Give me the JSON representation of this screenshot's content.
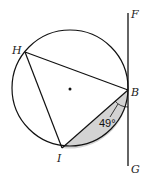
{
  "diagram": {
    "points": {
      "H": "H",
      "B": "B",
      "I": "I",
      "F": "F",
      "G": "G"
    },
    "angle_label": "49°",
    "colors": {
      "stroke": "#111111",
      "shade": "#d3d3d3"
    }
  }
}
